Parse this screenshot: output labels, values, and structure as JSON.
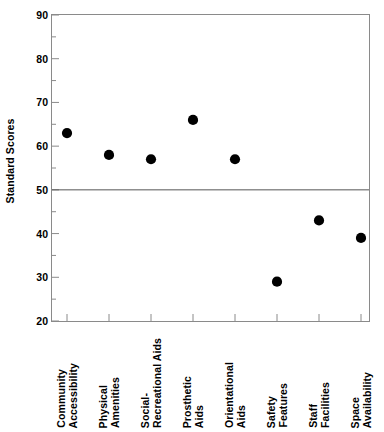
{
  "chart_data": {
    "type": "line",
    "title": "",
    "subtitle": "",
    "xlabel": "",
    "ylabel": "Standard Scores",
    "ylim": [
      20,
      90
    ],
    "ytick_step": 10,
    "yticks": [
      20,
      30,
      40,
      50,
      60,
      70,
      80,
      90
    ],
    "ytick_labels": [
      "20",
      "30",
      "40",
      "50",
      "60",
      "70",
      "80",
      "90"
    ],
    "minor_ytick_step": 5,
    "grid": false,
    "legend": null,
    "reference_line": {
      "value": 50,
      "orientation": "horizontal",
      "label": ""
    },
    "line_style": "dotted",
    "marker": "filled-circle",
    "marker_color": "#000000",
    "line_color": "#000000",
    "categories": [
      "Community Accessibility",
      "Physical Amenities",
      "Social-Recreational Aids",
      "Prosthetic Aids",
      "Orientational Aids",
      "Safety Features",
      "Staff Facilities",
      "Space Availability"
    ],
    "category_lines": [
      [
        "Community",
        "Accessibility"
      ],
      [
        "Physical",
        "Amenities"
      ],
      [
        "Social-",
        "Recreational Aids"
      ],
      [
        "Prosthetic",
        "Aids"
      ],
      [
        "Orientational",
        "Aids"
      ],
      [
        "Safety",
        "Features"
      ],
      [
        "Staff",
        "Facilities"
      ],
      [
        "Space",
        "Availability"
      ]
    ],
    "values": [
      63,
      58,
      57,
      66,
      57,
      29,
      43,
      39
    ]
  },
  "colors": {
    "axis": "#8a8a8a",
    "reference_line": "#555555",
    "marker": "#000000",
    "text": "#000000",
    "background": "#ffffff"
  }
}
